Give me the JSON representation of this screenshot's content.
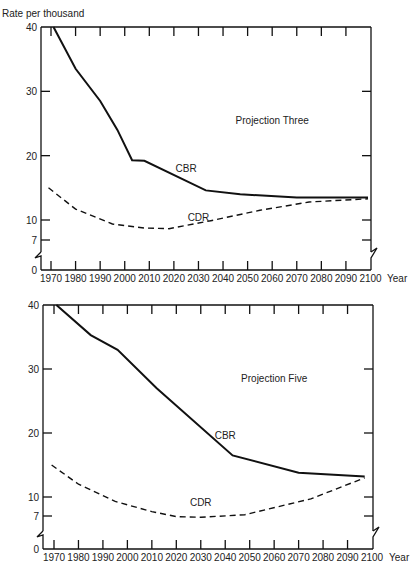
{
  "page": {
    "ylabel_header": "Rate per thousand",
    "x_unit": "Year"
  },
  "chart_data": [
    {
      "type": "line",
      "title": "Projection Three",
      "xlabel": "Year",
      "ylabel": "Rate per thousand",
      "ylim": [
        0,
        40
      ],
      "xlim": [
        1966,
        2100
      ],
      "yticks": [
        0,
        7,
        10,
        20,
        30,
        40
      ],
      "xticks": [
        1970,
        1980,
        1990,
        2000,
        2010,
        2020,
        2030,
        2040,
        2050,
        2060,
        2070,
        2080,
        2090,
        2100
      ],
      "axis_break": "between 0 and 7",
      "grid": false,
      "series": [
        {
          "name": "CBR",
          "style": "solid",
          "x": [
            1971,
            1980,
            1990,
            1997,
            2003,
            2008,
            2033,
            2047,
            2070,
            2099
          ],
          "values": [
            40,
            33.5,
            28.5,
            24,
            19.3,
            19.2,
            14.6,
            14.0,
            13.5,
            13.5
          ]
        },
        {
          "name": "CDR",
          "style": "dashed",
          "x": [
            1969,
            1980,
            1995,
            2008,
            2018,
            2035,
            2055,
            2075,
            2099
          ],
          "values": [
            15,
            11.7,
            9.4,
            8.8,
            8.7,
            9.9,
            11.5,
            12.8,
            13.3
          ]
        }
      ],
      "annotations": [
        {
          "text": "CBR",
          "x": 2025,
          "y": 17.4
        },
        {
          "text": "CDR",
          "x": 2030,
          "y": 9.8
        },
        {
          "text": "Projection Three",
          "x": 2060,
          "y": 25
        }
      ]
    },
    {
      "type": "line",
      "title": "Projection Five",
      "xlabel": "Year",
      "ylabel": "Rate per thousand",
      "ylim": [
        0,
        40
      ],
      "xlim": [
        1966,
        2100
      ],
      "yticks": [
        0,
        7,
        10,
        20,
        30,
        40
      ],
      "xticks": [
        1970,
        1980,
        1990,
        2000,
        2010,
        2020,
        2030,
        2040,
        2050,
        2060,
        2070,
        2080,
        2090,
        2100
      ],
      "axis_break": "between 0 and 7",
      "grid": false,
      "series": [
        {
          "name": "CBR",
          "style": "solid",
          "x": [
            1971,
            1985,
            1996,
            2012,
            2043,
            2070,
            2097
          ],
          "values": [
            40,
            35.3,
            33,
            27,
            16.5,
            13.8,
            13.2
          ]
        },
        {
          "name": "CDR",
          "style": "dashed",
          "x": [
            1969,
            1980,
            1995,
            2010,
            2020,
            2030,
            2048,
            2075,
            2097
          ],
          "values": [
            15,
            12,
            9.3,
            7.7,
            6.9,
            6.8,
            7.2,
            9.7,
            13
          ]
        }
      ],
      "annotations": [
        {
          "text": "CBR",
          "x": 2040,
          "y": 19
        },
        {
          "text": "CDR",
          "x": 2030,
          "y": 8.6
        },
        {
          "text": "Projection Five",
          "x": 2060,
          "y": 28
        }
      ]
    }
  ]
}
